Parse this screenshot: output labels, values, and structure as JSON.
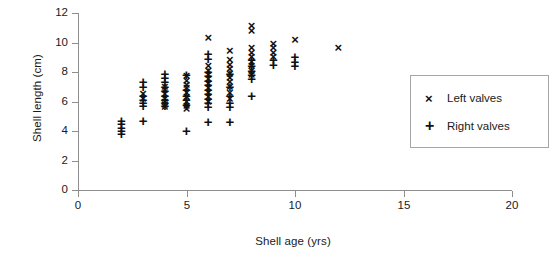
{
  "chart_data": {
    "type": "scatter",
    "title": "",
    "xlabel": "Shell age (yrs)",
    "ylabel": "Shell length (cm)",
    "xlim": [
      0,
      20
    ],
    "ylim": [
      0,
      12
    ],
    "xticks": [
      "0",
      "5",
      "10",
      "15",
      "20"
    ],
    "xtick_values": [
      0,
      5,
      10,
      15,
      20
    ],
    "yticks": [
      "0",
      "2",
      "4",
      "6",
      "8",
      "10",
      "12"
    ],
    "ytick_values": [
      0,
      2,
      4,
      6,
      8,
      10,
      12
    ],
    "grid": false,
    "legend_position": "right",
    "series": [
      {
        "name": "Left valves",
        "marker": "x",
        "points": [
          [
            3,
            6.5
          ],
          [
            3,
            6.2
          ],
          [
            4,
            7.0
          ],
          [
            4,
            6.8
          ],
          [
            4,
            6.5
          ],
          [
            4,
            6.2
          ],
          [
            4,
            6.0
          ],
          [
            4,
            5.8
          ],
          [
            4,
            5.6
          ],
          [
            5,
            7.7
          ],
          [
            5,
            7.4
          ],
          [
            5,
            7.1
          ],
          [
            5,
            6.9
          ],
          [
            5,
            6.6
          ],
          [
            5,
            6.3
          ],
          [
            5,
            6.0
          ],
          [
            5,
            5.7
          ],
          [
            5,
            5.5
          ],
          [
            6,
            10.3
          ],
          [
            6,
            8.4
          ],
          [
            6,
            8.1
          ],
          [
            6,
            7.8
          ],
          [
            6,
            7.5
          ],
          [
            6,
            7.2
          ],
          [
            6,
            6.9
          ],
          [
            6,
            6.6
          ],
          [
            6,
            6.3
          ],
          [
            6,
            6.0
          ],
          [
            7,
            9.4
          ],
          [
            7,
            8.8
          ],
          [
            7,
            8.5
          ],
          [
            7,
            8.2
          ],
          [
            7,
            7.9
          ],
          [
            7,
            7.6
          ],
          [
            7,
            7.3
          ],
          [
            7,
            7.0
          ],
          [
            7,
            6.6
          ],
          [
            7,
            6.2
          ],
          [
            8,
            11.1
          ],
          [
            8,
            10.8
          ],
          [
            8,
            9.6
          ],
          [
            8,
            9.3
          ],
          [
            8,
            9.0
          ],
          [
            8,
            8.7
          ],
          [
            8,
            8.4
          ],
          [
            8,
            8.1
          ],
          [
            8,
            7.8
          ],
          [
            9,
            9.9
          ],
          [
            9,
            9.6
          ],
          [
            9,
            9.3
          ],
          [
            9,
            9.0
          ],
          [
            10,
            10.2
          ],
          [
            12,
            9.6
          ]
        ]
      },
      {
        "name": "Right valves",
        "marker": "+",
        "points": [
          [
            2,
            4.7
          ],
          [
            2,
            4.5
          ],
          [
            2,
            4.2
          ],
          [
            2,
            4.0
          ],
          [
            2,
            3.8
          ],
          [
            3,
            7.3
          ],
          [
            3,
            7.0
          ],
          [
            3,
            6.4
          ],
          [
            3,
            6.1
          ],
          [
            3,
            5.9
          ],
          [
            3,
            5.7
          ],
          [
            3,
            4.7
          ],
          [
            4,
            7.9
          ],
          [
            4,
            7.6
          ],
          [
            4,
            7.3
          ],
          [
            4,
            7.0
          ],
          [
            4,
            6.7
          ],
          [
            4,
            6.4
          ],
          [
            4,
            6.1
          ],
          [
            4,
            5.9
          ],
          [
            4,
            5.7
          ],
          [
            5,
            7.8
          ],
          [
            5,
            6.8
          ],
          [
            5,
            6.4
          ],
          [
            5,
            6.1
          ],
          [
            5,
            5.8
          ],
          [
            5,
            4.0
          ],
          [
            6,
            9.2
          ],
          [
            6,
            8.9
          ],
          [
            6,
            8.0
          ],
          [
            6,
            7.7
          ],
          [
            6,
            7.4
          ],
          [
            6,
            7.1
          ],
          [
            6,
            6.8
          ],
          [
            6,
            6.5
          ],
          [
            6,
            6.2
          ],
          [
            6,
            5.9
          ],
          [
            6,
            5.6
          ],
          [
            6,
            4.6
          ],
          [
            7,
            7.9
          ],
          [
            7,
            7.0
          ],
          [
            7,
            6.4
          ],
          [
            7,
            5.9
          ],
          [
            7,
            5.6
          ],
          [
            7,
            4.6
          ],
          [
            8,
            8.8
          ],
          [
            8,
            8.4
          ],
          [
            8,
            8.1
          ],
          [
            8,
            7.8
          ],
          [
            8,
            7.5
          ],
          [
            8,
            6.4
          ],
          [
            9,
            8.8
          ],
          [
            9,
            8.5
          ],
          [
            10,
            9.0
          ],
          [
            10,
            8.7
          ],
          [
            10,
            8.4
          ]
        ]
      }
    ]
  },
  "legend": {
    "items": [
      {
        "symbol": "×",
        "label": "Left valves"
      },
      {
        "symbol": "+",
        "label": "Right valves"
      }
    ]
  }
}
